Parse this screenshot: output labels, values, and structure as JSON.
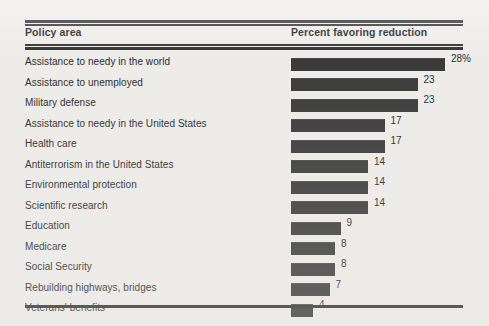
{
  "table": {
    "headers": {
      "policy_area": "Policy area",
      "percent": "Percent favoring reduction"
    }
  },
  "chart_data": {
    "type": "bar",
    "orientation": "horizontal",
    "title": "",
    "subtitle": "",
    "xlabel": "Percent favoring reduction",
    "ylabel": "Policy area",
    "grid": false,
    "legend": null,
    "xlim": [
      0,
      28
    ],
    "categories": [
      "Assistance to needy in the world",
      "Assistance to unemployed",
      "Military defense",
      "Assistance to needy in the United States",
      "Health care",
      "Antiterrorism in the United States",
      "Environmental protection",
      "Scientific research",
      "Education",
      "Medicare",
      "Social Security",
      "Rebuilding highways, bridges",
      "Veterans' benefits"
    ],
    "values": [
      28,
      23,
      23,
      17,
      17,
      14,
      14,
      14,
      9,
      8,
      8,
      7,
      4
    ],
    "value_labels": [
      "28%",
      "23",
      "23",
      "17",
      "17",
      "14",
      "14",
      "14",
      "9",
      "8",
      "8",
      "7",
      "4"
    ],
    "bar_color": "#3a3a3a",
    "background_color": "#edece9"
  }
}
